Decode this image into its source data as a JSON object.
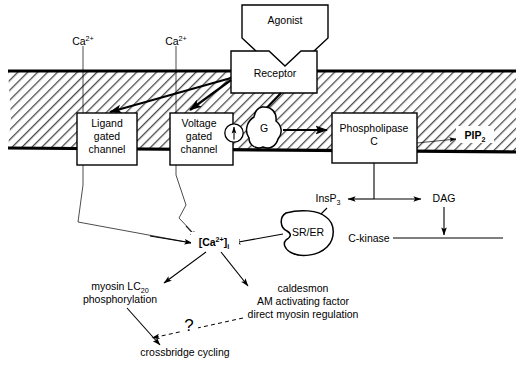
{
  "diagram": {
    "membrane": {
      "label": "plasma-membrane",
      "fill_color": "#ffffff",
      "hatch_color": "#555555",
      "border_color": "#000000"
    },
    "nodes": {
      "agonist": {
        "label": "Agonist"
      },
      "receptor": {
        "label": "Receptor"
      },
      "ligand_gated_channel": {
        "line1": "Ligand",
        "line2": "gated",
        "line3": "channel"
      },
      "voltage_gated_channel": {
        "line1": "Voltage",
        "line2": "gated",
        "line3": "channel"
      },
      "g_protein": {
        "label": "G"
      },
      "phospholipase_c": {
        "line1": "Phospholipase",
        "line2": "C"
      },
      "pip2": {
        "base": "PIP",
        "sub": "2"
      },
      "insp3": {
        "base": "InsP",
        "sub": "3"
      },
      "dag": {
        "label": "DAG"
      },
      "c_kinase": {
        "label": "C-kinase"
      },
      "sr_er": {
        "label": "SR/ER"
      },
      "calcium_internal": {
        "prefix": "[Ca",
        "sup": "2+",
        "suffix": "]",
        "sub": "i"
      },
      "calcium_extracellular_left": {
        "base": "Ca",
        "sup": "2+"
      },
      "calcium_extracellular_right": {
        "base": "Ca",
        "sup": "2+"
      },
      "myosin": {
        "line1_base": "myosin LC",
        "line1_sub": "20",
        "line2": "phosphorylation"
      },
      "caldesmon": {
        "line1": "caldesmon",
        "line2": "AM activating factor",
        "line3": "direct myosin regulation"
      },
      "crossbridge": {
        "label": "crossbridge cycling"
      },
      "question": {
        "label": "?"
      }
    }
  }
}
